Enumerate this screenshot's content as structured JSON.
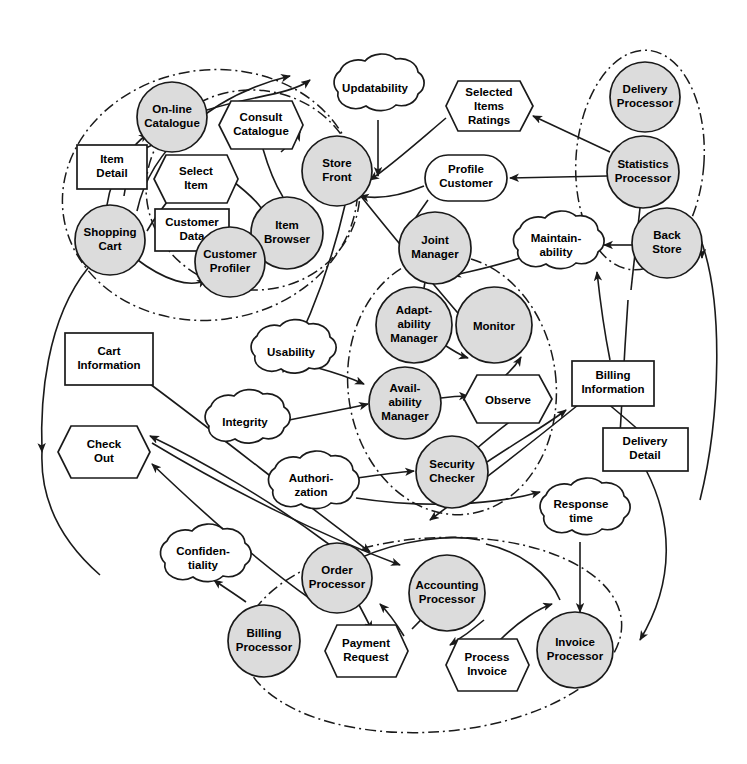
{
  "diagram": {
    "type": "i-star-strategic-dependency",
    "canvas": {
      "width": 747,
      "height": 764
    },
    "colors": {
      "actor_fill": "#dcdcdc",
      "element_fill": "#ffffff",
      "stroke": "#1a1a1a",
      "background": "#ffffff"
    },
    "legend": {
      "actor_shape": "circle",
      "resource_shape": "rectangle",
      "task_shape": "hexagon",
      "goal_shape": "rounded-rectangle",
      "softgoal_shape": "cloud",
      "boundary_style": "dash-dot ellipse"
    }
  },
  "actors": [
    {
      "id": "online-catalogue",
      "label": "On-line\nCatalogue",
      "line1": "On-line",
      "line2": "Catalogue",
      "cx": 172,
      "cy": 117,
      "r": 35
    },
    {
      "id": "store-front",
      "label": "Store\nFront",
      "line1": "Store",
      "line2": "Front",
      "cx": 337,
      "cy": 171,
      "r": 35
    },
    {
      "id": "shopping-cart",
      "label": "Shopping\nCart",
      "line1": "Shopping",
      "line2": "Cart",
      "cx": 110,
      "cy": 240,
      "r": 35
    },
    {
      "id": "item-browser",
      "label": "Item\nBrowser",
      "line1": "Item",
      "line2": "Browser",
      "cx": 287,
      "cy": 233,
      "r": 36
    },
    {
      "id": "customer-profiler",
      "label": "Customer\nProfiler",
      "line1": "Customer",
      "line2": "Profiler",
      "cx": 230,
      "cy": 262,
      "r": 35
    },
    {
      "id": "delivery-processor",
      "label": "Delivery\nProcessor",
      "line1": "Delivery",
      "line2": "Processor",
      "cx": 645,
      "cy": 97,
      "r": 35
    },
    {
      "id": "statistics-processor",
      "label": "Statistics\nProcessor",
      "line1": "Statistics",
      "line2": "Processor",
      "cx": 643,
      "cy": 172,
      "r": 36
    },
    {
      "id": "back-store",
      "label": "Back\nStore",
      "line1": "Back",
      "line2": "Store",
      "cx": 667,
      "cy": 243,
      "r": 35
    },
    {
      "id": "joint-manager",
      "label": "Joint\nManager",
      "line1": "Joint",
      "line2": "Manager",
      "cx": 435,
      "cy": 248,
      "r": 36
    },
    {
      "id": "adaptability-manager",
      "label": "Adapt-\nability\nManager",
      "line1": "Adapt-",
      "line2": "ability",
      "line3": "Manager",
      "cx": 414,
      "cy": 325,
      "r": 38
    },
    {
      "id": "monitor",
      "label": "Monitor",
      "line1": "Monitor",
      "cx": 494,
      "cy": 325,
      "r": 38
    },
    {
      "id": "availability-manager",
      "label": "Avail-\nability\nManager",
      "line1": "Avail-",
      "line2": "ability",
      "line3": "Manager",
      "cx": 405,
      "cy": 403,
      "r": 36
    },
    {
      "id": "security-checker",
      "label": "Security\nChecker",
      "line1": "Security",
      "line2": "Checker",
      "cx": 452,
      "cy": 472,
      "r": 36
    },
    {
      "id": "order-processor",
      "label": "Order\nProcessor",
      "line1": "Order",
      "line2": "Processor",
      "cx": 337,
      "cy": 578,
      "r": 35
    },
    {
      "id": "accounting-processor",
      "label": "Accounting\nProcessor",
      "line1": "Accounting",
      "line2": "Processor",
      "cx": 447,
      "cy": 593,
      "r": 38
    },
    {
      "id": "billing-processor",
      "label": "Billing\nProcessor",
      "line1": "Billing",
      "line2": "Processor",
      "cx": 264,
      "cy": 641,
      "r": 36
    },
    {
      "id": "invoice-processor",
      "label": "Invoice\nProcessor",
      "line1": "Invoice",
      "line2": "Processor",
      "cx": 575,
      "cy": 650,
      "r": 38
    }
  ],
  "resources": [
    {
      "id": "item-detail",
      "line1": "Item",
      "line2": "Detail",
      "x": 77,
      "y": 145,
      "w": 70,
      "h": 44
    },
    {
      "id": "customer-data",
      "line1": "Customer",
      "line2": "Data",
      "x": 155,
      "y": 209,
      "w": 74,
      "h": 42
    },
    {
      "id": "cart-information",
      "line1": "Cart",
      "line2": "Information",
      "x": 65,
      "y": 333,
      "w": 88,
      "h": 52
    },
    {
      "id": "billing-information",
      "line1": "Billing",
      "line2": "Information",
      "x": 572,
      "y": 361,
      "w": 82,
      "h": 45
    },
    {
      "id": "delivery-detail",
      "line1": "Delivery",
      "line2": "Detail",
      "x": 603,
      "y": 428,
      "w": 85,
      "h": 43
    }
  ],
  "tasks": [
    {
      "id": "consult-catalogue",
      "line1": "Consult",
      "line2": "Catalogue",
      "cx": 261,
      "cy": 125,
      "w": 84,
      "h": 48
    },
    {
      "id": "select-item",
      "line1": "Select",
      "line2": "Item",
      "cx": 196,
      "cy": 179,
      "w": 84,
      "h": 48
    },
    {
      "id": "selected-items-ratings",
      "line1": "Selected",
      "line2": "Items",
      "line3": "Ratings",
      "cx": 489,
      "cy": 106,
      "w": 86,
      "h": 50
    },
    {
      "id": "observe",
      "line1": "Observe",
      "cx": 508,
      "cy": 399,
      "w": 88,
      "h": 48
    },
    {
      "id": "check-out",
      "line1": "Check",
      "line2": "Out",
      "cx": 104,
      "cy": 452,
      "w": 92,
      "h": 53
    },
    {
      "id": "payment-request",
      "line1": "Payment",
      "line2": "Request",
      "cx": 366,
      "cy": 651,
      "w": 84,
      "h": 53
    },
    {
      "id": "process-invoice",
      "line1": "Process",
      "line2": "Invoice",
      "cx": 487,
      "cy": 665,
      "w": 84,
      "h": 53
    }
  ],
  "goals": [
    {
      "id": "profile-customer",
      "line1": "Profile",
      "line2": "Customer",
      "x": 425,
      "y": 155,
      "w": 82,
      "h": 46
    }
  ],
  "softgoals": [
    {
      "id": "updatability",
      "line1": "Updatability",
      "cx": 375,
      "cy": 88,
      "rx": 48,
      "ry": 30
    },
    {
      "id": "maintainability",
      "line1": "Maintain-",
      "line2": "ability",
      "cx": 556,
      "cy": 245,
      "rx": 46,
      "ry": 31
    },
    {
      "id": "usability",
      "line1": "Usability",
      "cx": 291,
      "cy": 352,
      "rx": 44,
      "ry": 29
    },
    {
      "id": "integrity",
      "line1": "Integrity",
      "cx": 245,
      "cy": 422,
      "rx": 44,
      "ry": 29
    },
    {
      "id": "authorization",
      "line1": "Authori-",
      "line2": "zation",
      "cx": 311,
      "cy": 485,
      "rx": 46,
      "ry": 31
    },
    {
      "id": "response-time",
      "line1": "Response",
      "line2": "time",
      "cx": 581,
      "cy": 512,
      "rx": 45,
      "ry": 30
    },
    {
      "id": "confidentiality",
      "line1": "Confiden-",
      "line2": "tiality",
      "cx": 203,
      "cy": 558,
      "rx": 47,
      "ry": 31
    }
  ],
  "boundaries": [
    {
      "id": "store-front-boundary",
      "cx": 210,
      "cy": 195,
      "rx": 148,
      "ry": 125,
      "rotate": -8
    },
    {
      "id": "catalogue-boundary",
      "cx": 253,
      "cy": 190,
      "rx": 107,
      "ry": 100,
      "rotate": 6
    },
    {
      "id": "back-office-boundary",
      "cx": 640,
      "cy": 160,
      "rx": 64,
      "ry": 110,
      "rotate": 4
    },
    {
      "id": "manager-boundary",
      "cx": 452,
      "cy": 385,
      "rx": 104,
      "ry": 130,
      "rotate": -7
    },
    {
      "id": "payment-boundary",
      "cx": 432,
      "cy": 635,
      "rx": 190,
      "ry": 97,
      "rotate": -4
    }
  ],
  "dependency_count": 42,
  "notes": {
    "diagram_kind": "Strategic Dependency / agent-goal model of an on-line shopping system",
    "shape_key": "shaded circles = agents/actors, plain rectangles = resources, hexagons = tasks, rounded rectangle = goal, clouds = softgoals, dash-dot ellipses = actor boundaries"
  }
}
